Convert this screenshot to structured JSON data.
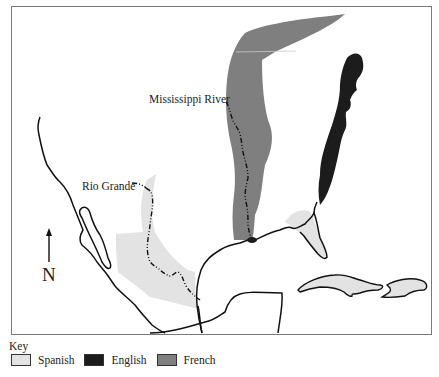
{
  "map": {
    "labels": {
      "mississippi": "Mississippi River",
      "rio_grande": "Rio Grande",
      "north": "N"
    },
    "colors": {
      "spanish": "#e3e3e3",
      "english": "#1c1c1c",
      "french": "#7f7f7f",
      "coastline": "#111111",
      "frame": "#7a7a7a"
    }
  },
  "key": {
    "title": "Key",
    "items": [
      {
        "label": "Spanish",
        "color": "#e3e3e3"
      },
      {
        "label": "English",
        "color": "#1c1c1c"
      },
      {
        "label": "French",
        "color": "#7f7f7f"
      }
    ]
  }
}
